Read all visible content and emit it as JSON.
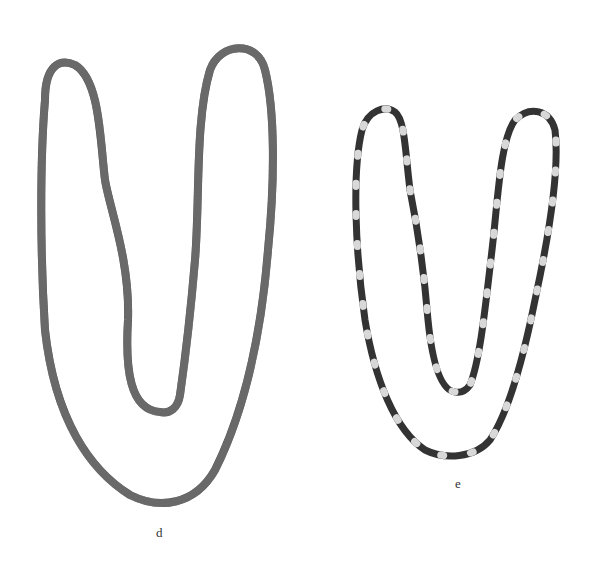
{
  "figure": {
    "labels": {
      "necklace_d": "d",
      "necklace_e": "e"
    },
    "colors": {
      "background": "#ffffff",
      "bead_dark": "#3a3a3a",
      "bead_mid": "#555555",
      "bead_light": "#d8d8d8"
    }
  }
}
